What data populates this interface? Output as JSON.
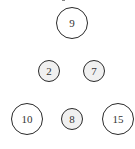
{
  "diagram": {
    "nodes": [
      {
        "id": "top",
        "label": "9",
        "cx": 72,
        "cy": 23,
        "r": 16,
        "fill": "#ffffff"
      },
      {
        "id": "mid-left",
        "label": "2",
        "cx": 49,
        "cy": 71,
        "r": 11,
        "fill": "#f0f0f0"
      },
      {
        "id": "mid-right",
        "label": "7",
        "cx": 94,
        "cy": 71,
        "r": 11,
        "fill": "#f0f0f0"
      },
      {
        "id": "bottom-left",
        "label": "10",
        "cx": 27,
        "cy": 119,
        "r": 16,
        "fill": "#ffffff"
      },
      {
        "id": "bottom-center",
        "label": "8",
        "cx": 72,
        "cy": 119,
        "r": 11,
        "fill": "#f0f0f0"
      },
      {
        "id": "bottom-right",
        "label": "15",
        "cx": 118,
        "cy": 119,
        "r": 16,
        "fill": "#ffffff"
      }
    ]
  }
}
